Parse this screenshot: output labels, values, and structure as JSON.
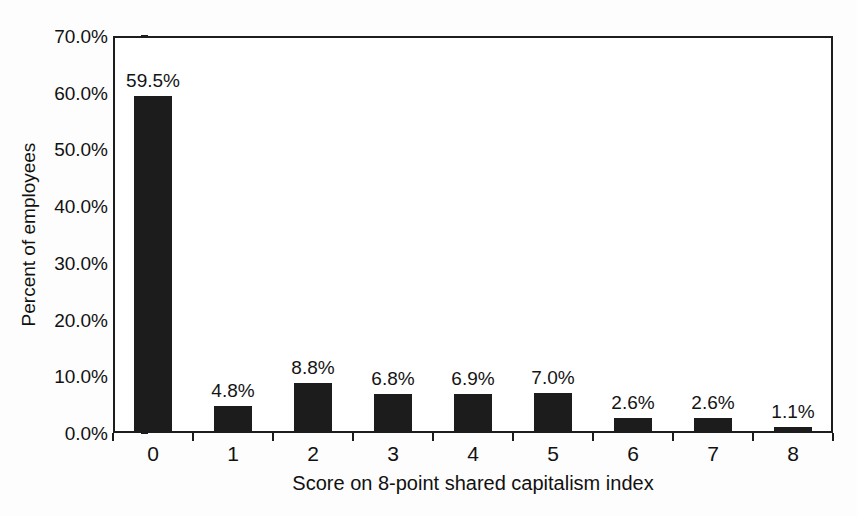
{
  "chart_data": {
    "type": "bar",
    "title": "",
    "xlabel": "Score on 8-point shared capitalism index",
    "ylabel": "Percent of employees",
    "categories": [
      "0",
      "1",
      "2",
      "3",
      "4",
      "5",
      "6",
      "7",
      "8"
    ],
    "values": [
      59.5,
      4.8,
      8.8,
      6.8,
      6.9,
      7.0,
      2.6,
      2.6,
      1.1
    ],
    "data_labels": [
      "59.5%",
      "4.8%",
      "8.8%",
      "6.8%",
      "6.9%",
      "7.0%",
      "2.6%",
      "2.6%",
      "1.1%"
    ],
    "ylim": [
      0,
      70
    ],
    "ytick_values": [
      0,
      10,
      20,
      30,
      40,
      50,
      60,
      70
    ],
    "ytick_labels": [
      "0.0%",
      "10.0%",
      "20.0%",
      "30.0%",
      "40.0%",
      "50.0%",
      "60.0%",
      "70.0%"
    ],
    "grid": false,
    "legend": false,
    "legend_position": "none",
    "bar_color": "#1c1c1c",
    "axis_color": "#1d1d1d",
    "background_color": "#ffffff"
  }
}
